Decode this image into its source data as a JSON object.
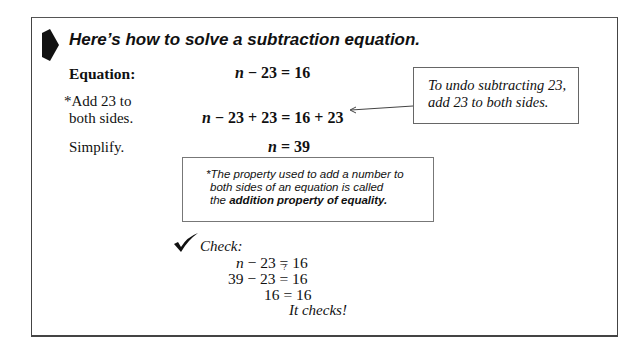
{
  "heading": "Here’s how to solve a subtraction equation.",
  "steps": [
    {
      "label": "Equation:",
      "label_bold": true,
      "var": "n",
      "rest": " − 23 = 16"
    },
    {
      "label_lines": [
        "*Add 23 to",
        "both sides."
      ],
      "var": "n",
      "rest": " − 23 + 23 = 16 + 23"
    },
    {
      "label": "Simplify.",
      "var": "n",
      "rest": " = 39"
    }
  ],
  "callout": {
    "lines": [
      "To undo subtracting 23,",
      "add 23 to both sides."
    ]
  },
  "note": {
    "line1": "*The property used to add a number to",
    "line2": "both sides of an equation is called",
    "line3_prefix": "the ",
    "line3_bold": "addition property of equality."
  },
  "check": {
    "label": "Check:",
    "line1": {
      "var": "n",
      "rest": " − 23 = 16"
    },
    "line2": {
      "left": "39 − 23 ",
      "mark": "?",
      "eq": "=",
      "right": " 16"
    },
    "line3": "16 = 16",
    "result": "It checks!"
  },
  "colors": {
    "text": "#111111",
    "border": "#444444",
    "background": "#ffffff"
  }
}
